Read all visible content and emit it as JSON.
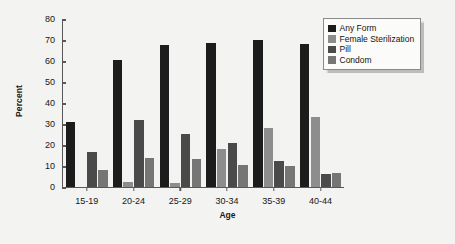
{
  "chart_data": {
    "type": "bar",
    "title": "",
    "xlabel": "Age",
    "ylabel": "Percent",
    "categories": [
      "15-19",
      "20-24",
      "25-29",
      "30-34",
      "35-39",
      "40-44"
    ],
    "series": [
      {
        "name": "Any Form",
        "color": "#1c1c1c",
        "values": [
          31,
          60.5,
          67.5,
          68.5,
          70,
          68
        ]
      },
      {
        "name": "Female Sterilization",
        "color": "#8d8d8d",
        "values": [
          0,
          2,
          1.5,
          18,
          28,
          33
        ]
      },
      {
        "name": "Pill",
        "color": "#4a4a4a",
        "values": [
          16.5,
          31.5,
          25,
          21,
          12,
          6
        ]
      },
      {
        "name": "Condom",
        "color": "#767676",
        "values": [
          8,
          13.5,
          13,
          10.5,
          10,
          6.5
        ]
      }
    ],
    "ylim": [
      0,
      80
    ],
    "yticks": [
      0,
      10,
      20,
      30,
      40,
      50,
      60,
      70,
      80
    ],
    "ytick_labels": [
      "0",
      "10",
      "20",
      "30",
      "40",
      "50",
      "60",
      "70",
      "80"
    ],
    "grid": false,
    "legend_position": "top-right",
    "axis_color": "#58585a",
    "background_color": "#f3f3f1"
  }
}
